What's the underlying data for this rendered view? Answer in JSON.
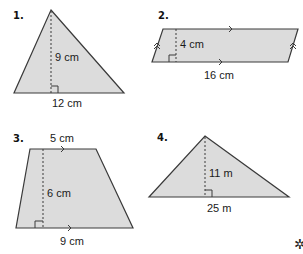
{
  "figures": [
    {
      "number": "1.",
      "shape": "triangle",
      "height_label": "9 cm",
      "base_label": "12 cm"
    },
    {
      "number": "2.",
      "shape": "parallelogram",
      "height_label": "4 cm",
      "base_label": "16 cm"
    },
    {
      "number": "3.",
      "shape": "trapezoid",
      "top_label": "5 cm",
      "height_label": "6 cm",
      "base_label": "9 cm"
    },
    {
      "number": "4.",
      "shape": "triangle",
      "height_label": "11 m",
      "base_label": "25 m"
    }
  ],
  "corner_mark": "✲"
}
